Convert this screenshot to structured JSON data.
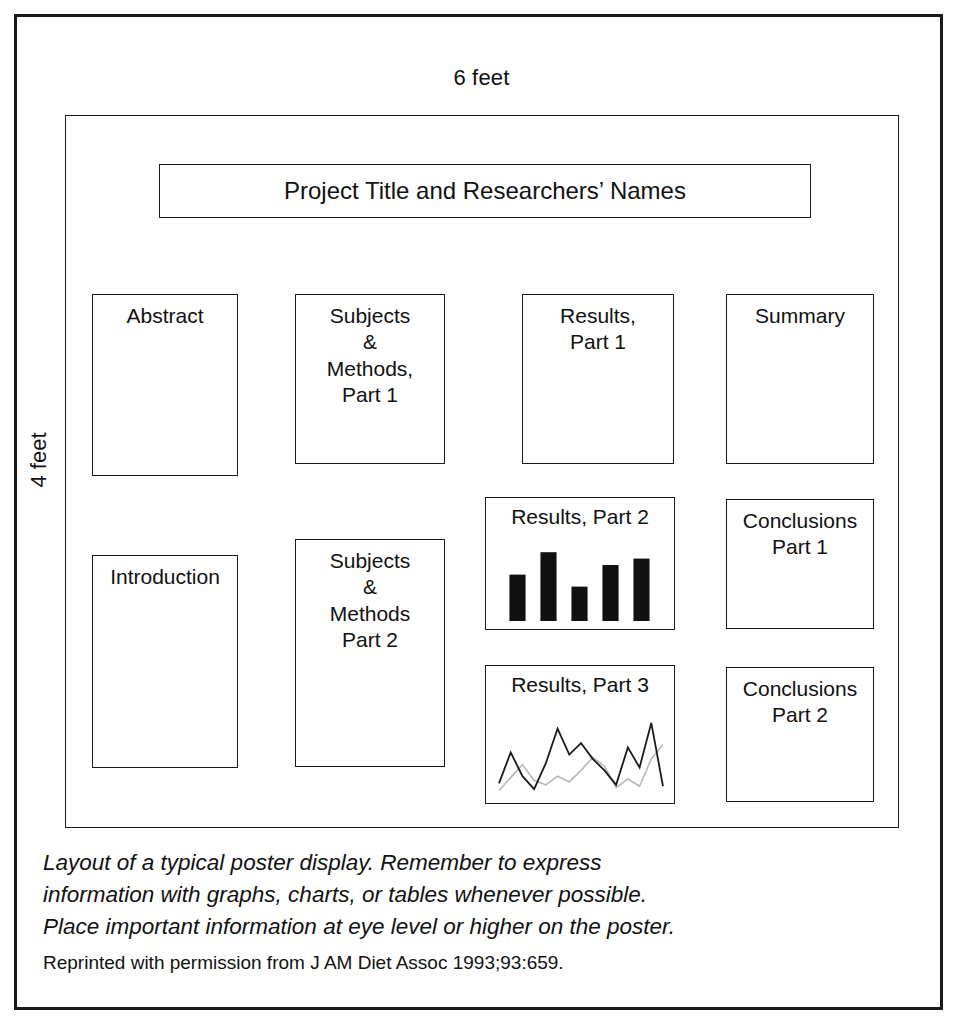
{
  "figure": {
    "width_label": "6 feet",
    "height_label": "4 feet",
    "caption_lines": [
      "Layout of a typical poster display. Remember to express",
      "information with graphs, charts, or tables whenever possible.",
      "Place important information at eye level or higher on the poster."
    ],
    "attribution": "Reprinted with permission from J AM Diet Assoc 1993;93:659."
  },
  "poster": {
    "title_panel": "Project Title and Researchers’ Names",
    "panels": {
      "abstract": "Abstract",
      "subjects_methods_1": "Subjects\n&\nMethods,\nPart 1",
      "results_1": "Results,\nPart 1",
      "summary": "Summary",
      "introduction": "Introduction",
      "subjects_methods_2": "Subjects\n&\nMethods\nPart 2",
      "results_2": "Results, Part 2",
      "conclusions_1": "Conclusions\nPart 1",
      "results_3": "Results, Part 3",
      "conclusions_2": "Conclusions\nPart 2"
    }
  },
  "chart_data": [
    {
      "type": "bar",
      "title": "Results, Part 2",
      "categories": [
        "1",
        "2",
        "3",
        "4",
        "5"
      ],
      "values": [
        58,
        86,
        43,
        70,
        78
      ],
      "xlabel": "",
      "ylabel": "",
      "ylim": [
        0,
        100
      ],
      "grid": false,
      "legend": "none",
      "bar_color": "#111111"
    },
    {
      "type": "line",
      "title": "Results, Part 3",
      "x": [
        0,
        1,
        2,
        3,
        4,
        5,
        6,
        7,
        8,
        9,
        10,
        11,
        12,
        13,
        14
      ],
      "series": [
        {
          "name": "series-dark",
          "color": "#1a1a1a",
          "values": [
            12,
            55,
            22,
            4,
            40,
            88,
            52,
            68,
            46,
            30,
            10,
            62,
            34,
            96,
            8
          ]
        },
        {
          "name": "series-light",
          "color": "#b8b8b8",
          "values": [
            2,
            20,
            38,
            16,
            10,
            22,
            14,
            30,
            48,
            36,
            6,
            18,
            8,
            46,
            66
          ]
        }
      ],
      "xlabel": "",
      "ylabel": "",
      "ylim": [
        0,
        100
      ],
      "grid": false,
      "legend": "none"
    }
  ]
}
